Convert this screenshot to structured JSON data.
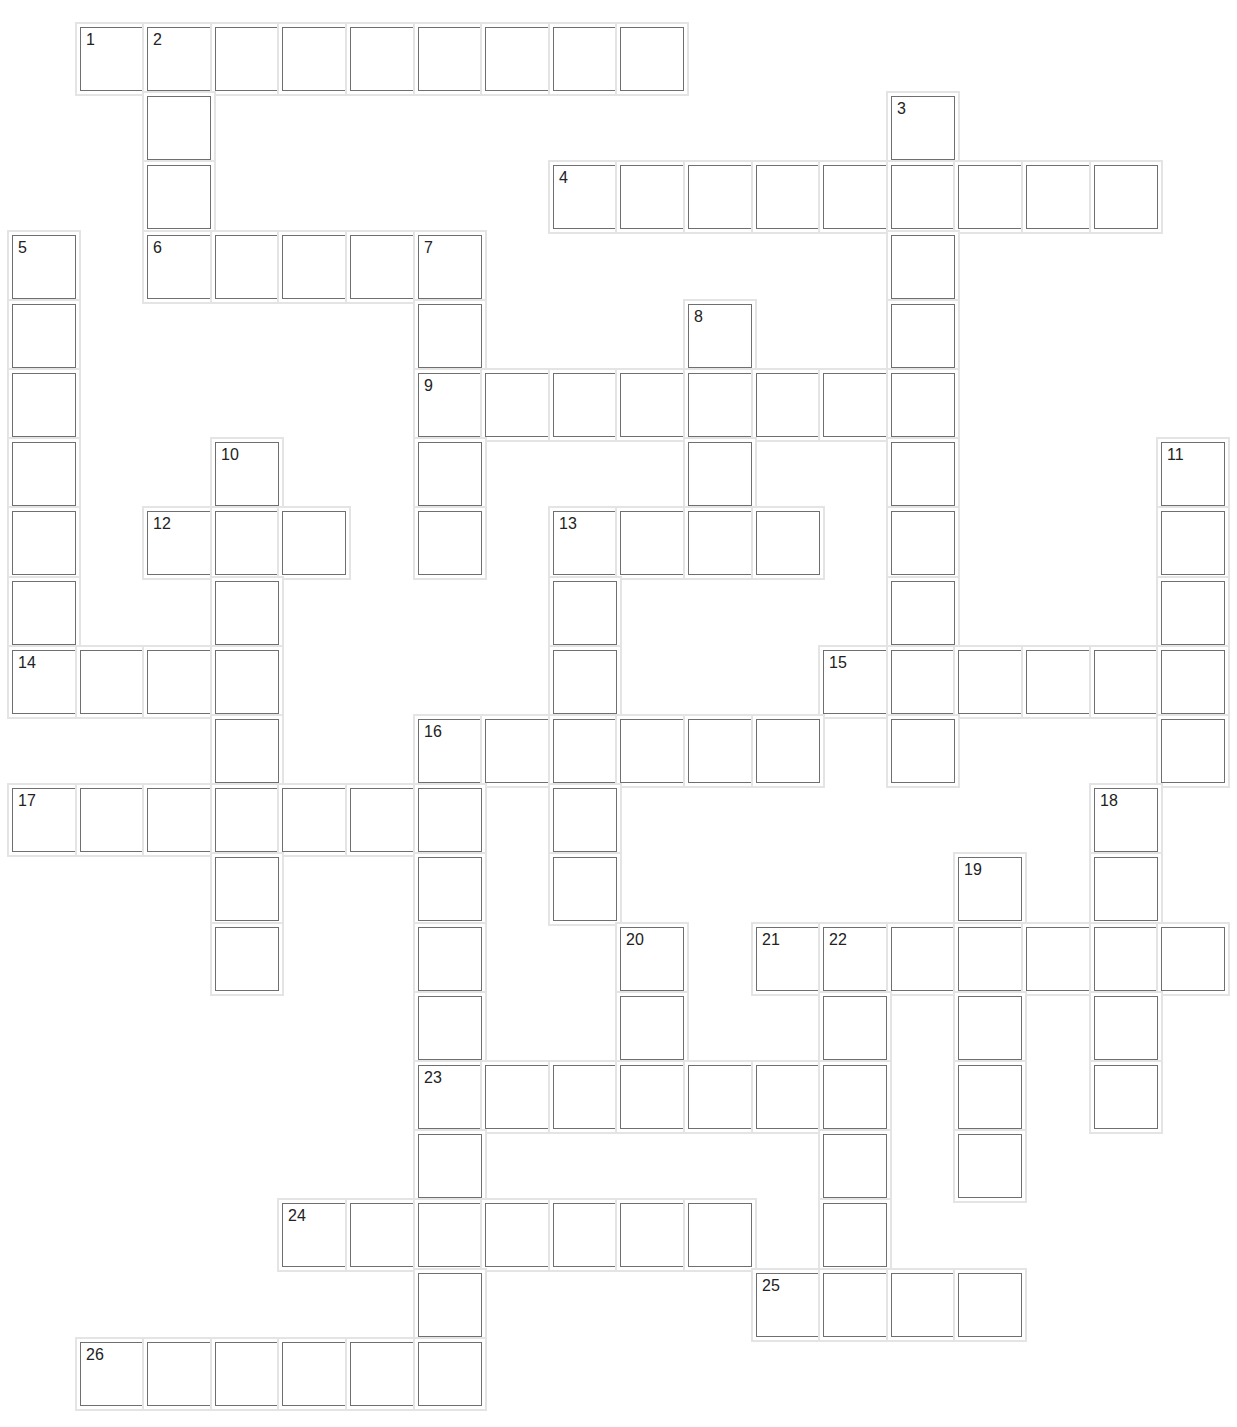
{
  "puzzle": {
    "type": "crossword",
    "grid_origin": {
      "x": 12,
      "y": 27
    },
    "pitch": {
      "x": 67.6,
      "y": 69.2
    },
    "cell_size": 64,
    "cells": [
      [
        0,
        1,
        "1"
      ],
      [
        0,
        2,
        "2"
      ],
      [
        0,
        3,
        ""
      ],
      [
        0,
        4,
        ""
      ],
      [
        0,
        5,
        ""
      ],
      [
        0,
        6,
        ""
      ],
      [
        0,
        7,
        ""
      ],
      [
        0,
        8,
        ""
      ],
      [
        0,
        9,
        ""
      ],
      [
        1,
        2,
        ""
      ],
      [
        1,
        13,
        "3"
      ],
      [
        2,
        2,
        ""
      ],
      [
        2,
        8,
        "4"
      ],
      [
        2,
        9,
        ""
      ],
      [
        2,
        10,
        ""
      ],
      [
        2,
        11,
        ""
      ],
      [
        2,
        12,
        ""
      ],
      [
        2,
        13,
        ""
      ],
      [
        2,
        14,
        ""
      ],
      [
        2,
        15,
        ""
      ],
      [
        2,
        16,
        ""
      ],
      [
        3,
        0,
        "5"
      ],
      [
        3,
        2,
        "6"
      ],
      [
        3,
        3,
        ""
      ],
      [
        3,
        4,
        ""
      ],
      [
        3,
        5,
        ""
      ],
      [
        3,
        6,
        "7"
      ],
      [
        3,
        13,
        ""
      ],
      [
        4,
        0,
        ""
      ],
      [
        4,
        6,
        ""
      ],
      [
        4,
        10,
        "8"
      ],
      [
        4,
        13,
        ""
      ],
      [
        5,
        0,
        ""
      ],
      [
        5,
        6,
        "9"
      ],
      [
        5,
        7,
        ""
      ],
      [
        5,
        8,
        ""
      ],
      [
        5,
        9,
        ""
      ],
      [
        5,
        10,
        ""
      ],
      [
        5,
        11,
        ""
      ],
      [
        5,
        12,
        ""
      ],
      [
        5,
        13,
        ""
      ],
      [
        6,
        0,
        ""
      ],
      [
        6,
        3,
        "10"
      ],
      [
        6,
        6,
        ""
      ],
      [
        6,
        10,
        ""
      ],
      [
        6,
        13,
        ""
      ],
      [
        6,
        17,
        "11"
      ],
      [
        7,
        0,
        ""
      ],
      [
        7,
        2,
        "12"
      ],
      [
        7,
        3,
        ""
      ],
      [
        7,
        4,
        ""
      ],
      [
        7,
        6,
        ""
      ],
      [
        7,
        8,
        "13"
      ],
      [
        7,
        9,
        ""
      ],
      [
        7,
        10,
        ""
      ],
      [
        7,
        11,
        ""
      ],
      [
        7,
        13,
        ""
      ],
      [
        7,
        17,
        ""
      ],
      [
        8,
        0,
        ""
      ],
      [
        8,
        3,
        ""
      ],
      [
        8,
        8,
        ""
      ],
      [
        8,
        13,
        ""
      ],
      [
        8,
        17,
        ""
      ],
      [
        9,
        0,
        "14"
      ],
      [
        9,
        1,
        ""
      ],
      [
        9,
        2,
        ""
      ],
      [
        9,
        3,
        ""
      ],
      [
        9,
        8,
        ""
      ],
      [
        9,
        12,
        "15"
      ],
      [
        9,
        13,
        ""
      ],
      [
        9,
        14,
        ""
      ],
      [
        9,
        15,
        ""
      ],
      [
        9,
        16,
        ""
      ],
      [
        9,
        17,
        ""
      ],
      [
        10,
        3,
        ""
      ],
      [
        10,
        6,
        "16"
      ],
      [
        10,
        7,
        ""
      ],
      [
        10,
        8,
        ""
      ],
      [
        10,
        9,
        ""
      ],
      [
        10,
        10,
        ""
      ],
      [
        10,
        11,
        ""
      ],
      [
        10,
        13,
        ""
      ],
      [
        10,
        17,
        ""
      ],
      [
        11,
        0,
        "17"
      ],
      [
        11,
        1,
        ""
      ],
      [
        11,
        2,
        ""
      ],
      [
        11,
        3,
        ""
      ],
      [
        11,
        4,
        ""
      ],
      [
        11,
        5,
        ""
      ],
      [
        11,
        6,
        ""
      ],
      [
        11,
        8,
        ""
      ],
      [
        11,
        16,
        "18"
      ],
      [
        12,
        3,
        ""
      ],
      [
        12,
        6,
        ""
      ],
      [
        12,
        8,
        ""
      ],
      [
        12,
        14,
        "19"
      ],
      [
        12,
        16,
        ""
      ],
      [
        13,
        3,
        ""
      ],
      [
        13,
        6,
        ""
      ],
      [
        13,
        9,
        "20"
      ],
      [
        13,
        11,
        "21"
      ],
      [
        13,
        12,
        "22"
      ],
      [
        13,
        13,
        ""
      ],
      [
        13,
        14,
        ""
      ],
      [
        13,
        15,
        ""
      ],
      [
        13,
        16,
        ""
      ],
      [
        13,
        17,
        ""
      ],
      [
        14,
        6,
        ""
      ],
      [
        14,
        9,
        ""
      ],
      [
        14,
        12,
        ""
      ],
      [
        14,
        14,
        ""
      ],
      [
        14,
        16,
        ""
      ],
      [
        15,
        6,
        "23"
      ],
      [
        15,
        7,
        ""
      ],
      [
        15,
        8,
        ""
      ],
      [
        15,
        9,
        ""
      ],
      [
        15,
        10,
        ""
      ],
      [
        15,
        11,
        ""
      ],
      [
        15,
        12,
        ""
      ],
      [
        15,
        14,
        ""
      ],
      [
        15,
        16,
        ""
      ],
      [
        16,
        6,
        ""
      ],
      [
        16,
        12,
        ""
      ],
      [
        16,
        14,
        ""
      ],
      [
        17,
        4,
        "24"
      ],
      [
        17,
        5,
        ""
      ],
      [
        17,
        6,
        ""
      ],
      [
        17,
        7,
        ""
      ],
      [
        17,
        8,
        ""
      ],
      [
        17,
        9,
        ""
      ],
      [
        17,
        10,
        ""
      ],
      [
        17,
        12,
        ""
      ],
      [
        18,
        6,
        ""
      ],
      [
        18,
        11,
        "25"
      ],
      [
        18,
        12,
        ""
      ],
      [
        18,
        13,
        ""
      ],
      [
        18,
        14,
        ""
      ],
      [
        19,
        1,
        "26"
      ],
      [
        19,
        2,
        ""
      ],
      [
        19,
        3,
        ""
      ],
      [
        19,
        4,
        ""
      ],
      [
        19,
        5,
        ""
      ],
      [
        19,
        6,
        ""
      ]
    ]
  }
}
